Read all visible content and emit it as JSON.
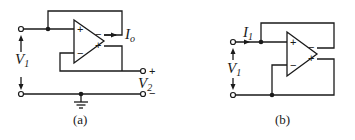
{
  "diagram": {
    "type": "circuit-schematic",
    "colors": {
      "stroke": "#1a1a1a",
      "background": "#ffffff"
    },
    "circuit_a": {
      "caption": "(a)",
      "labels": {
        "input_voltage": "V",
        "input_voltage_sub": "1",
        "output_current": "I",
        "output_current_sub": "o",
        "output_voltage": "V",
        "output_voltage_sub": "2",
        "out_plus": "+",
        "out_minus": "−"
      },
      "opamp": {
        "in_plus": "+",
        "in_minus": "−",
        "out_minus": "−",
        "out_plus": "+"
      }
    },
    "circuit_b": {
      "caption": "(b)",
      "labels": {
        "input_current": "I",
        "input_current_sub": "1",
        "input_voltage": "V",
        "input_voltage_sub": "1"
      },
      "opamp": {
        "in_plus": "+",
        "in_minus": "−",
        "out_minus": "−",
        "out_plus": "+"
      }
    }
  }
}
